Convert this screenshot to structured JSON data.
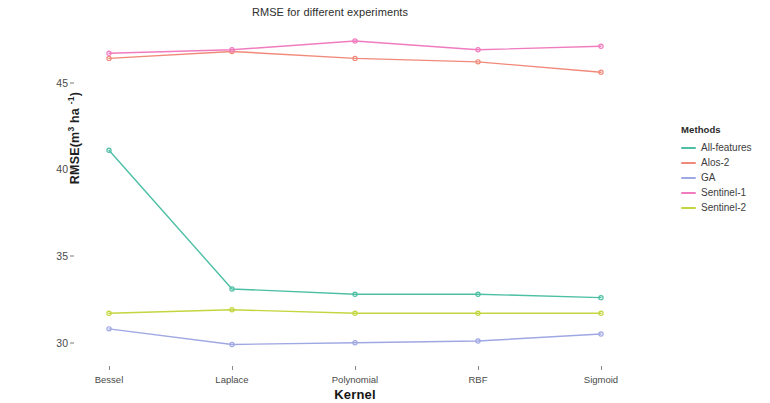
{
  "chart_data": {
    "type": "line",
    "title": "RMSE for different experiments",
    "xlabel": "Kernel",
    "ylabel": "RMSE(m3 ha-1)",
    "categories": [
      "Bessel",
      "Laplace",
      "Polynomial",
      "RBF",
      "Sigmoid"
    ],
    "ylim": [
      28.6,
      48.5
    ],
    "yticks": [
      30,
      35,
      40,
      45
    ],
    "ytick_labels": [
      "30",
      "35",
      "40",
      "45"
    ],
    "grid": false,
    "legend_position": "right",
    "legend_title": "Methods",
    "series": [
      {
        "name": "All-features",
        "color": "#4dbfa4",
        "values": [
          41.1,
          33.1,
          32.8,
          32.8,
          32.6
        ]
      },
      {
        "name": "Alos-2",
        "color": "#f0897a",
        "values": [
          46.4,
          46.8,
          46.4,
          46.2,
          45.6
        ]
      },
      {
        "name": "GA",
        "color": "#9fa8e3",
        "values": [
          30.8,
          29.9,
          30.0,
          30.1,
          30.5
        ]
      },
      {
        "name": "Sentinel-1",
        "color": "#f07cbf",
        "values": [
          46.7,
          46.9,
          47.4,
          46.9,
          47.1
        ]
      },
      {
        "name": "Sentinel-2",
        "color": "#c4d63f",
        "values": [
          31.7,
          31.9,
          31.7,
          31.7,
          31.7
        ]
      }
    ]
  },
  "yaxis": {
    "title_prefix": "RMSE(m",
    "title_sup1": "3",
    "title_mid": " ha ",
    "title_sup2": "-1",
    "title_suffix": ")"
  }
}
